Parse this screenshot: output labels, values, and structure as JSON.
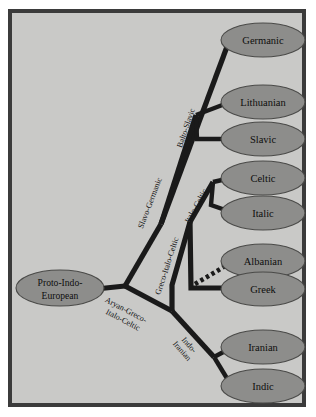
{
  "figure": {
    "kind": "phylogenetic-tree",
    "colors": {
      "page_background": "#ffffff",
      "panel_background": "#c9c9c7",
      "frame_border": "#3b3b3b",
      "node_fill": "#8d8d8b",
      "node_stroke": "#4a4a48",
      "branch": "#1a1a1a",
      "text": "#0d0d0d"
    }
  },
  "root": {
    "id": "proto-indo-european",
    "line1": "Proto-Indo-",
    "line2": "European"
  },
  "leaves": [
    {
      "id": "germanic",
      "label": "Germanic"
    },
    {
      "id": "lithuanian",
      "label": "Lithuanian"
    },
    {
      "id": "slavic",
      "label": "Slavic"
    },
    {
      "id": "celtic",
      "label": "Celtic"
    },
    {
      "id": "italic",
      "label": "Italic"
    },
    {
      "id": "albanian",
      "label": "Albanian"
    },
    {
      "id": "greek",
      "label": "Greek"
    },
    {
      "id": "iranian",
      "label": "Iranian"
    },
    {
      "id": "indic",
      "label": "Indic"
    }
  ],
  "branch_labels": [
    {
      "id": "slavo-germanic",
      "line1": "Slavo-Germanic",
      "line2": ""
    },
    {
      "id": "balto-slavic",
      "line1": "Balto-Slavic",
      "line2": ""
    },
    {
      "id": "italo-celtic",
      "line1": "Italo-Celtic",
      "line2": ""
    },
    {
      "id": "greco-italo-celtic",
      "line1": "Greco-Italo-Celtic",
      "line2": ""
    },
    {
      "id": "aryan-greco-italo-celtic",
      "line1": "Aryan-Greco-",
      "line2": "Italo-Celtic"
    },
    {
      "id": "indo-iranian",
      "line1": "Indo-",
      "line2": "Iranian"
    }
  ],
  "relationships": {
    "dashed_note": "Albanian is attached by a dashed branch indicating an uncertain affiliation"
  }
}
